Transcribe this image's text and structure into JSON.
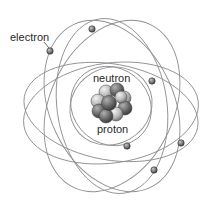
{
  "diagram": {
    "labels": {
      "electron": "electron",
      "neutron": "neutron",
      "proton": "proton"
    },
    "colors": {
      "orbit": "#8f8f8f",
      "electron": "#6e6e6e",
      "nucleon_light": "#d8d8d8",
      "nucleon_dark": "#5a5a5a",
      "text": "#2a2a2a"
    },
    "electron_count": 6
  }
}
